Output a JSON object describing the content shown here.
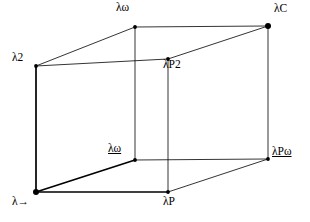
{
  "figure": {
    "kind": "lambda-cube",
    "background_color": "#ffffff",
    "stroke_color": "#000000",
    "vertex_color": "#000000"
  },
  "vertices": {
    "lam_to": {
      "label_prefix": "λ",
      "label_suffix": "→",
      "underline": false,
      "x": 36,
      "y": 192,
      "dot": "large"
    },
    "lam2": {
      "label_prefix": "λ",
      "label_suffix": "2",
      "underline": false,
      "x": 36,
      "y": 66,
      "dot": "small"
    },
    "lam_omega_top": {
      "label_prefix": "λ",
      "label_suffix": "ω",
      "underline": false,
      "x": 135,
      "y": 27,
      "dot": "small"
    },
    "lam_omega_mid": {
      "label_prefix": "λ",
      "label_suffix": "ω",
      "underline": true,
      "x": 135,
      "y": 160,
      "dot": "small"
    },
    "lamP": {
      "label_prefix": "λP",
      "label_suffix": "",
      "underline": false,
      "x": 168,
      "y": 192,
      "dot": "small"
    },
    "lamP2": {
      "label_prefix": "λP",
      "label_suffix": "2",
      "underline": false,
      "x": 168,
      "y": 59,
      "dot": "small"
    },
    "lamP_omega": {
      "label_prefix": "λP",
      "label_suffix": "ω",
      "underline": true,
      "x": 268,
      "y": 159,
      "dot": "small"
    },
    "lamC": {
      "label_prefix": "λ",
      "label_suffix": "C",
      "underline": false,
      "x": 268,
      "y": 26,
      "dot": "large"
    }
  },
  "labels": {
    "lam_to": "λ→",
    "lam2": "λ2",
    "lam_omega_top": "λω",
    "lam_omega_mid": "λω",
    "lamP": "λP",
    "lamP2": "λP2",
    "lamP_omega": "λPω",
    "lamC": "λC"
  },
  "edges": [
    {
      "name": "lam_to--lamP",
      "from": "lam_to",
      "to": "lamP",
      "weight": "bold"
    },
    {
      "name": "lam_to--lam_omega_mid",
      "from": "lam_to",
      "to": "lam_omega_mid",
      "weight": "bold"
    },
    {
      "name": "lam_to--lam2",
      "from": "lam_to",
      "to": "lam2",
      "weight": "bold"
    },
    {
      "name": "lam2--lam_omega_top",
      "from": "lam2",
      "to": "lam_omega_top",
      "weight": "thin"
    },
    {
      "name": "lam2--lamP2",
      "from": "lam2",
      "to": "lamP2",
      "weight": "thin"
    },
    {
      "name": "lam_omega_top--lamC",
      "from": "lam_omega_top",
      "to": "lamC",
      "weight": "thin"
    },
    {
      "name": "lam_omega_top--lam_omega_mid",
      "from": "lam_omega_top",
      "to": "lam_omega_mid",
      "weight": "thin"
    },
    {
      "name": "lamP2--lamC",
      "from": "lamP2",
      "to": "lamC",
      "weight": "thin"
    },
    {
      "name": "lamP2--lamP",
      "from": "lamP2",
      "to": "lamP",
      "weight": "thin"
    },
    {
      "name": "lamP--lamP_omega",
      "from": "lamP",
      "to": "lamP_omega",
      "weight": "thin"
    },
    {
      "name": "lamC--lamP_omega",
      "from": "lamC",
      "to": "lamP_omega",
      "weight": "thin"
    },
    {
      "name": "lam_omega_mid--lamP_omega",
      "from": "lam_omega_mid",
      "to": "lamP_omega",
      "weight": "thin"
    }
  ]
}
